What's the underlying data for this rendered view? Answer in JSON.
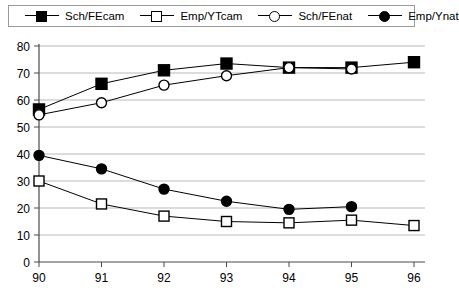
{
  "legend": {
    "position": "top",
    "entries": [
      {
        "label": "Sch/FEcam",
        "marker": "filled-square",
        "icon": "filled-square-icon"
      },
      {
        "label": "Emp/YTcam",
        "marker": "open-square",
        "icon": "open-square-icon"
      },
      {
        "label": "Sch/FEnat",
        "marker": "open-circle",
        "icon": "open-circle-icon"
      },
      {
        "label": "Emp/Ynat",
        "marker": "filled-circle",
        "icon": "filled-circle-icon"
      }
    ]
  },
  "axes": {
    "x_ticks": [
      "90",
      "91",
      "92",
      "93",
      "94",
      "95",
      "96"
    ],
    "y_ticks": [
      "0",
      "10",
      "20",
      "30",
      "40",
      "50",
      "60",
      "70",
      "80"
    ]
  },
  "chart_data": {
    "type": "line",
    "title": "",
    "xlabel": "",
    "ylabel": "",
    "x": [
      90,
      91,
      92,
      93,
      94,
      95,
      96
    ],
    "categories": [
      "90",
      "91",
      "92",
      "93",
      "94",
      "95",
      "96"
    ],
    "xlim": [
      90,
      96
    ],
    "ylim": [
      0,
      80
    ],
    "yticks": [
      0,
      10,
      20,
      30,
      40,
      50,
      60,
      70,
      80
    ],
    "grid": "horizontal",
    "legend_position": "top",
    "series": [
      {
        "name": "Sch/FEcam",
        "marker": "filled-square",
        "color": "#000000",
        "values": [
          56.5,
          66,
          71,
          73.5,
          72,
          72,
          74
        ]
      },
      {
        "name": "Emp/YTcam",
        "marker": "open-square",
        "color": "#000000",
        "values": [
          30,
          21.5,
          17,
          15,
          14.5,
          15.5,
          13.5
        ]
      },
      {
        "name": "Sch/FEnat",
        "marker": "open-circle",
        "color": "#000000",
        "values": [
          54.5,
          59,
          65.5,
          69,
          72,
          71.5,
          null
        ]
      },
      {
        "name": "Emp/Ynat",
        "marker": "filled-circle",
        "color": "#000000",
        "values": [
          39.5,
          34.5,
          27,
          22.5,
          19.5,
          20.5,
          null
        ]
      }
    ]
  }
}
